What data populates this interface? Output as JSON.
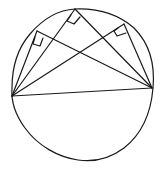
{
  "diagram": {
    "stroke_color": "#1a1a1a",
    "background": "#ffffff",
    "circle": {
      "cx": 82,
      "cy": 85,
      "rx": 71,
      "ry": 76
    },
    "diameter": {
      "a": [
        12,
        96
      ],
      "b": [
        152,
        88
      ]
    },
    "vertices": [
      {
        "id": "P1",
        "point": [
          37,
          31
        ],
        "right_angle": true
      },
      {
        "id": "P2",
        "point": [
          75,
          9
        ],
        "right_angle": true
      },
      {
        "id": "P3",
        "point": [
          124,
          24
        ],
        "right_angle": true
      }
    ]
  }
}
